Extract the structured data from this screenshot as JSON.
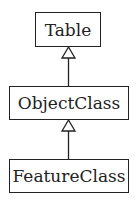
{
  "diagram": {
    "type": "uml-class-inheritance",
    "nodes": [
      {
        "id": "table",
        "label": "Table"
      },
      {
        "id": "objectclass",
        "label": "ObjectClass"
      },
      {
        "id": "featureclass",
        "label": "FeatureClass"
      }
    ],
    "edges": [
      {
        "from": "objectclass",
        "to": "table",
        "type": "generalization"
      },
      {
        "from": "featureclass",
        "to": "objectclass",
        "type": "generalization"
      }
    ]
  }
}
